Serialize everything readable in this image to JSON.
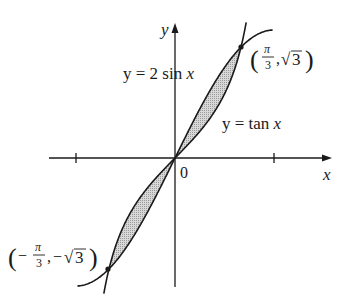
{
  "figure": {
    "axes": {
      "x_label": "x",
      "y_label": "y",
      "origin_label": "0",
      "x_ticks": [
        "-π/2",
        "π/2"
      ]
    },
    "curves": [
      {
        "name": "sine-curve",
        "label_lhs": "y = 2 sin ",
        "label_var": "x",
        "equation": "y = 2 sin x"
      },
      {
        "name": "tangent-curve",
        "label_lhs": "y = tan ",
        "label_var": "x",
        "equation": "y = tan x"
      }
    ],
    "points": [
      {
        "name": "upper-intersection",
        "x": "π/3",
        "y": "√3",
        "num": "π",
        "den": "3",
        "yval": "3",
        "sign": ""
      },
      {
        "name": "lower-intersection",
        "x": "-π/3",
        "y": "-√3",
        "num": "π",
        "den": "3",
        "yval": "3",
        "sign": "−"
      }
    ],
    "shaded_region": "area between y = 2 sin x and y = tan x on [-π/3, π/3]",
    "colors": {
      "ink": "#1a1a1a",
      "shade": "#cfcfcf"
    }
  }
}
